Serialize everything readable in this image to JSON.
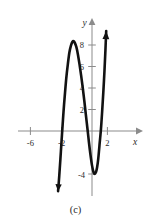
{
  "figure": {
    "caption": "(c)",
    "background_color": "#ffffff",
    "curve_color": "#121212",
    "axis_color": "#8b8b8b",
    "label_color": "#2b2b2b"
  },
  "chart_data": {
    "type": "line",
    "title": "",
    "subtitle": "",
    "xlabel": "x",
    "ylabel": "y",
    "xlim": [
      -8.2,
      3.3
    ],
    "ylim": [
      -6.1,
      10.2
    ],
    "grid": false,
    "legend": null,
    "x_ticks": [
      -6,
      -2,
      2
    ],
    "x_tick_labels": [
      "-6",
      "-2",
      "2"
    ],
    "y_ticks": [
      2,
      4,
      6,
      8
    ],
    "y_tick_labels": [
      "2",
      "4",
      "6",
      "8"
    ],
    "annotations": [
      {
        "text": "-4",
        "x": -0.75,
        "y": -4.0
      }
    ],
    "series": [
      {
        "name": "cubic",
        "arrow_start": true,
        "arrow_end": true,
        "local_maximum": {
          "x": -2.4,
          "y": 8.3
        },
        "local_minimum": {
          "x": 0.35,
          "y": -4.0
        },
        "x_intercepts": [
          -3.8,
          -0.55,
          1.15
        ],
        "points": [
          {
            "x": -4.35,
            "y": -5.6
          },
          {
            "x": -4.2,
            "y": -4.2
          },
          {
            "x": -4.05,
            "y": -2.6
          },
          {
            "x": -3.9,
            "y": -0.9
          },
          {
            "x": -3.8,
            "y": 0.2
          },
          {
            "x": -3.65,
            "y": 1.8
          },
          {
            "x": -3.5,
            "y": 3.2
          },
          {
            "x": -3.3,
            "y": 4.9
          },
          {
            "x": -3.1,
            "y": 6.2
          },
          {
            "x": -2.9,
            "y": 7.3
          },
          {
            "x": -2.7,
            "y": 7.95
          },
          {
            "x": -2.5,
            "y": 8.3
          },
          {
            "x": -2.35,
            "y": 8.35
          },
          {
            "x": -2.2,
            "y": 8.2
          },
          {
            "x": -2.0,
            "y": 7.8
          },
          {
            "x": -1.8,
            "y": 7.1
          },
          {
            "x": -1.6,
            "y": 6.2
          },
          {
            "x": -1.4,
            "y": 5.2
          },
          {
            "x": -1.2,
            "y": 4.1
          },
          {
            "x": -1.0,
            "y": 2.9
          },
          {
            "x": -0.8,
            "y": 1.6
          },
          {
            "x": -0.55,
            "y": 0.0
          },
          {
            "x": -0.4,
            "y": -1.0
          },
          {
            "x": -0.2,
            "y": -2.2
          },
          {
            "x": 0.0,
            "y": -3.2
          },
          {
            "x": 0.2,
            "y": -3.85
          },
          {
            "x": 0.35,
            "y": -4.0
          },
          {
            "x": 0.5,
            "y": -3.85
          },
          {
            "x": 0.65,
            "y": -3.4
          },
          {
            "x": 0.8,
            "y": -2.6
          },
          {
            "x": 0.95,
            "y": -1.4
          },
          {
            "x": 1.15,
            "y": 0.2
          },
          {
            "x": 1.3,
            "y": 1.8
          },
          {
            "x": 1.45,
            "y": 3.6
          },
          {
            "x": 1.6,
            "y": 5.6
          },
          {
            "x": 1.72,
            "y": 7.5
          },
          {
            "x": 1.82,
            "y": 9.3
          }
        ]
      }
    ]
  }
}
